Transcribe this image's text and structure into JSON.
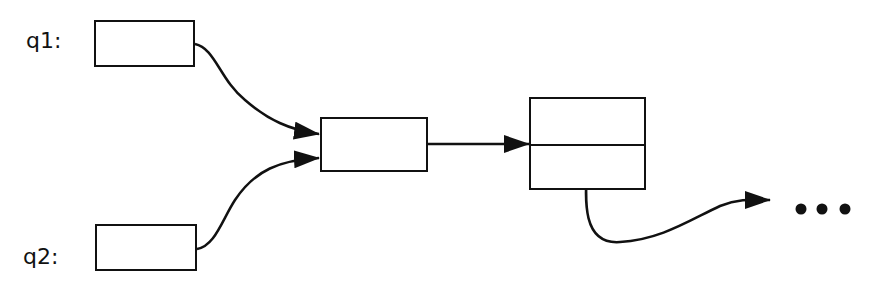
{
  "diagram": {
    "labels": {
      "q1": "q1:",
      "q2": "q2:"
    },
    "nodes": [
      {
        "id": "q1-box",
        "x": 94,
        "y": 20,
        "w": 101,
        "h": 47
      },
      {
        "id": "q2-box",
        "x": 95,
        "y": 224,
        "w": 102,
        "h": 47
      },
      {
        "id": "merge-box",
        "x": 320,
        "y": 117,
        "w": 108,
        "h": 55
      },
      {
        "id": "cell-box",
        "x": 529,
        "y": 97,
        "w": 117,
        "h": 93,
        "divider_y": 144
      }
    ],
    "edges": [
      {
        "from": "q1-box",
        "to": "merge-box"
      },
      {
        "from": "q2-box",
        "to": "merge-box"
      },
      {
        "from": "merge-box",
        "to": "cell-box"
      },
      {
        "from": "cell-box.lower",
        "to": "continuation"
      }
    ],
    "continuation": "•••",
    "stroke_color": "#111111"
  }
}
